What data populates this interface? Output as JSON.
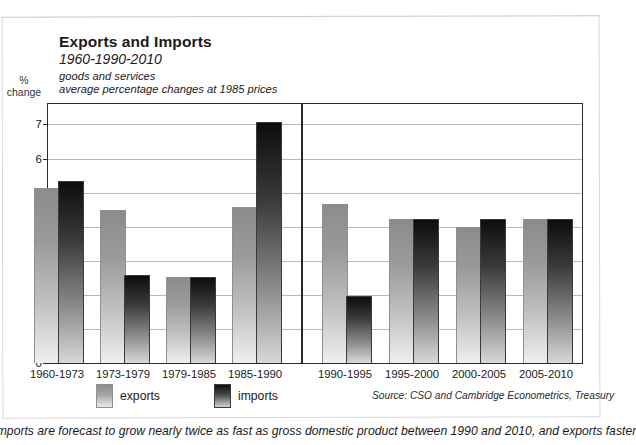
{
  "header": {
    "title": "Exports and Imports",
    "subtitle": "1960-1990-2010",
    "note1": "goods and services",
    "note2": "average percentage changes at 1985 prices"
  },
  "axis_unit": {
    "line1": "%",
    "line2": "change"
  },
  "legend": {
    "exports_label": "exports",
    "imports_label": "imports"
  },
  "source_note": "Source: CSO and Cambridge Econometrics, Treasury",
  "caption": "imports are forecast to grow nearly twice as fast as gross domestic product between 1990 and 2010, and exports faster",
  "colors": {
    "exports_top": "#8c8c8c",
    "exports_bottom": "#efefef",
    "imports_top": "#0d0d0d",
    "imports_bottom": "#d8d8d8",
    "axis": "#2b2b2b",
    "gridline": "#b9b9b9"
  },
  "chart_data": {
    "type": "bar",
    "title": "Exports and Imports",
    "subtitle": "1960-1990-2010",
    "annotations": [
      "goods and services",
      "average percentage changes at 1985 prices"
    ],
    "xlabel": "",
    "ylabel": "% change",
    "ylim": [
      0,
      7.6
    ],
    "yticks": [
      0,
      1,
      2,
      3,
      4,
      5,
      6,
      7
    ],
    "ytick_labels": [
      "0",
      "1",
      "2",
      "3",
      "4",
      "5",
      "6",
      "7"
    ],
    "grid": true,
    "legend_position": "below-left",
    "categories": [
      "1960-1973",
      "1973-1979",
      "1979-1985",
      "1985-1990",
      "1990-1995",
      "1995-2000",
      "2000-2005",
      "2005-2010"
    ],
    "series": [
      {
        "name": "exports",
        "values": [
          5.1,
          4.45,
          2.5,
          4.55,
          4.65,
          4.2,
          3.95,
          4.2
        ]
      },
      {
        "name": "imports",
        "values": [
          5.3,
          2.55,
          2.5,
          7.05,
          1.95,
          4.2,
          4.2,
          4.2
        ]
      }
    ],
    "divider_after_category": "1985-1990",
    "divider_note": "vertical rule separating historical outturn from forecast"
  }
}
